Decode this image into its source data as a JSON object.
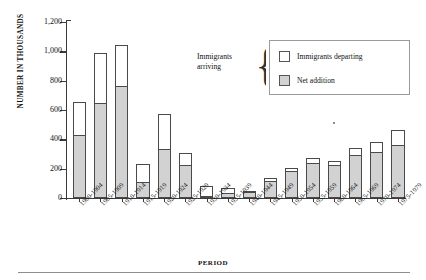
{
  "chart_data": {
    "type": "bar",
    "subtype": "stacked",
    "title": "",
    "xlabel": "PERIOD",
    "ylabel": "NUMBER IN THOUSANDS",
    "ylim": [
      0,
      1200
    ],
    "ytick_values": [
      0,
      200,
      400,
      600,
      800,
      1000,
      1200
    ],
    "ytick_labels": [
      "0",
      "200",
      "400",
      "600",
      "800",
      "1,000",
      "1,200"
    ],
    "grid": false,
    "legend_position": "top-right",
    "legend_caption": "Immigrants arriving",
    "legend_entries": [
      {
        "label": "Immigrants departing",
        "swatch": "white"
      },
      {
        "label": "Net addition",
        "swatch": "gray"
      }
    ],
    "categories": [
      "1900-1904",
      "1905-1909",
      "1910-1914",
      "1915-1919",
      "1920-1924",
      "1925-1929",
      "1930-1934",
      "1935-1939",
      "1940-1944",
      "1945-1949",
      "1950-1954",
      "1955-1959",
      "1960-1964",
      "1965-1969",
      "1970-1974",
      "1975-1979"
    ],
    "series": [
      {
        "name": "Immigrants arriving",
        "note": "total bar height = arriving",
        "values": [
          655,
          990,
          1040,
          230,
          575,
          310,
          85,
          65,
          50,
          135,
          205,
          275,
          255,
          340,
          380,
          465
        ]
      },
      {
        "name": "Net addition",
        "note": "shaded lower portion of each bar",
        "values": [
          420,
          640,
          755,
          105,
          330,
          215,
          10,
          30,
          35,
          110,
          180,
          230,
          215,
          285,
          305,
          355
        ]
      },
      {
        "name": "Immigrants departing",
        "note": "white upper portion = arriving minus net addition",
        "values": [
          235,
          350,
          285,
          125,
          245,
          95,
          75,
          35,
          15,
          25,
          25,
          45,
          40,
          55,
          75,
          110
        ]
      }
    ],
    "colors": {
      "net_addition_fill": "#d2d2d2",
      "departing_fill": "#ffffff",
      "bar_outline": "#4a4a4a",
      "axis": "#3b3b3b",
      "text": "#111111"
    }
  }
}
